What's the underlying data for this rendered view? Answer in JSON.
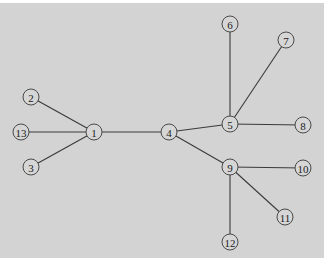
{
  "diagram": {
    "type": "tree",
    "background": "#d3d3d3",
    "node_radius": 8,
    "nodes": [
      {
        "id": "1",
        "label": "1",
        "x": 94,
        "y": 132
      },
      {
        "id": "2",
        "label": "2",
        "x": 31,
        "y": 97
      },
      {
        "id": "3",
        "label": "3",
        "x": 31,
        "y": 167
      },
      {
        "id": "4",
        "label": "4",
        "x": 169,
        "y": 132
      },
      {
        "id": "5",
        "label": "5",
        "x": 230,
        "y": 124
      },
      {
        "id": "6",
        "label": "6",
        "x": 230,
        "y": 24
      },
      {
        "id": "7",
        "label": "7",
        "x": 286,
        "y": 40
      },
      {
        "id": "8",
        "label": "8",
        "x": 303,
        "y": 125
      },
      {
        "id": "9",
        "label": "9",
        "x": 230,
        "y": 167
      },
      {
        "id": "10",
        "label": "10",
        "x": 303,
        "y": 168
      },
      {
        "id": "11",
        "label": "11",
        "x": 285,
        "y": 217
      },
      {
        "id": "12",
        "label": "12",
        "x": 230,
        "y": 242
      },
      {
        "id": "13",
        "label": "13",
        "x": 21,
        "y": 132
      }
    ],
    "edges": [
      [
        "1",
        "2"
      ],
      [
        "1",
        "13"
      ],
      [
        "1",
        "3"
      ],
      [
        "1",
        "4"
      ],
      [
        "4",
        "5"
      ],
      [
        "4",
        "9"
      ],
      [
        "5",
        "6"
      ],
      [
        "5",
        "7"
      ],
      [
        "5",
        "8"
      ],
      [
        "9",
        "10"
      ],
      [
        "9",
        "11"
      ],
      [
        "9",
        "12"
      ]
    ]
  }
}
